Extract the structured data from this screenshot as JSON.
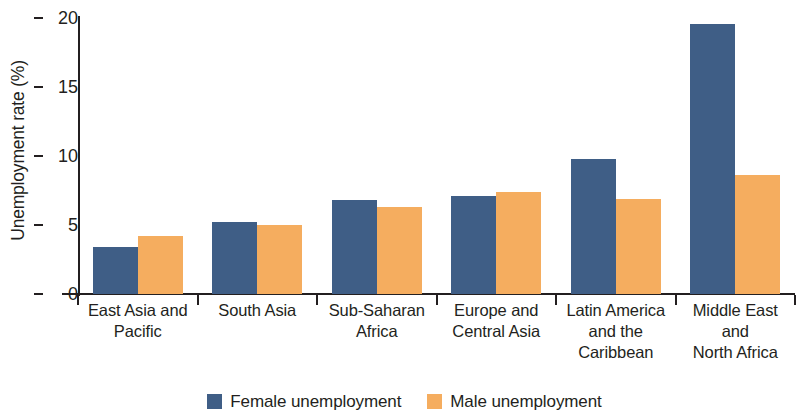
{
  "chart_data": {
    "type": "bar",
    "title": "",
    "subtitle": "",
    "xlabel": "",
    "ylabel": "Unemployment rate (%)",
    "categories": [
      "East Asia and Pacific",
      "South Asia",
      "Sub-Saharan Africa",
      "Europe and Central Asia",
      "Latin America and the Caribbean",
      "Middle East and North Africa"
    ],
    "category_lines": [
      [
        "East Asia and",
        "Pacific"
      ],
      [
        "South Asia"
      ],
      [
        "Sub-Saharan",
        "Africa"
      ],
      [
        "Europe and",
        "Central Asia"
      ],
      [
        "Latin America",
        "and the",
        "Caribbean"
      ],
      [
        "Middle East",
        "and",
        "North Africa"
      ]
    ],
    "series": [
      {
        "name": "Female unemployment",
        "color": "#3f5e86",
        "values": [
          3.4,
          5.2,
          6.8,
          7.1,
          9.8,
          19.6
        ]
      },
      {
        "name": "Male unemployment",
        "color": "#f5ad5f",
        "values": [
          4.2,
          5.0,
          6.3,
          7.4,
          6.9,
          8.6
        ]
      }
    ],
    "ylim": [
      0,
      20
    ],
    "yticks": [
      0,
      5,
      10,
      15,
      20
    ],
    "ytick_labels": [
      "0",
      "5",
      "10",
      "15",
      "20"
    ],
    "grid": false,
    "legend_position": "bottom-center"
  },
  "legend": {
    "entries": [
      {
        "label": "Female unemployment"
      },
      {
        "label": "Male unemployment"
      }
    ]
  }
}
